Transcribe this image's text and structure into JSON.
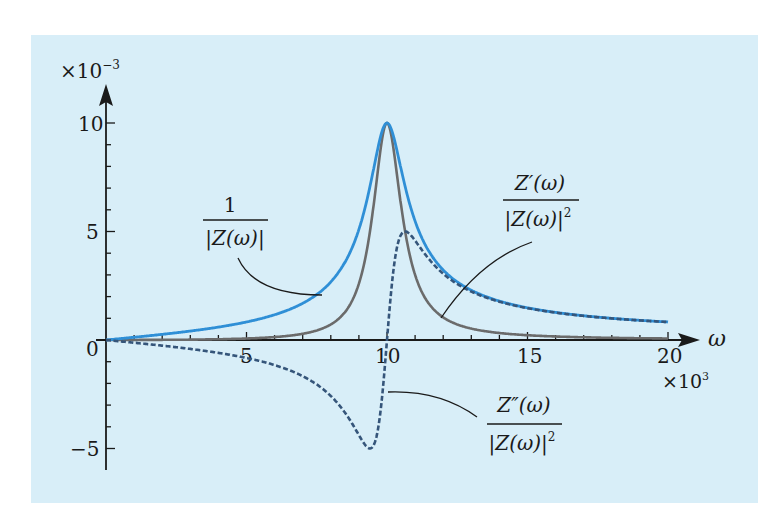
{
  "chart_data": {
    "type": "line",
    "title": "",
    "xlabel": "ω",
    "ylabel": "",
    "x_multiplier": "×10³",
    "y_multiplier": "×10⁻³",
    "xlim": [
      0,
      20
    ],
    "ylim": [
      -5.5,
      11
    ],
    "x_ticks": [
      0,
      5,
      10,
      15,
      20
    ],
    "x_tick_labels": [
      "0",
      "5",
      "10",
      "15",
      "20"
    ],
    "x_minor_step": 1,
    "y_ticks": [
      -5,
      5,
      10
    ],
    "y_tick_labels": [
      "−5",
      "5",
      "10"
    ],
    "y_minor_step": 1,
    "origin_label": "0",
    "grid": false,
    "legend": "inline annotations",
    "model": {
      "R": 100,
      "L": 0.08,
      "omega0_k": 10
    },
    "x": [
      0,
      1,
      2,
      3,
      4,
      5,
      6,
      7,
      8,
      9,
      9.5,
      10,
      10.5,
      11,
      12,
      13,
      14,
      15,
      16,
      17,
      18,
      19,
      20
    ],
    "series": [
      {
        "name": "1/|Z(ω)|",
        "style": "solid",
        "color": "#2f8fd6",
        "values": [
          0,
          0.13,
          0.26,
          0.41,
          0.59,
          0.83,
          1.17,
          1.7,
          2.64,
          5.05,
          7.37,
          10.0,
          7.58,
          5.47,
          3.14,
          2.16,
          1.65,
          1.33,
          1.12,
          0.97,
          0.85,
          0.76,
          0.69
        ]
      },
      {
        "name": "Z'(ω)/|Z(ω)|²",
        "style": "solid",
        "color": "#6b6b6b",
        "values": [
          0,
          0.0,
          0.01,
          0.02,
          0.03,
          0.07,
          0.14,
          0.29,
          0.7,
          2.55,
          5.43,
          10.0,
          5.75,
          2.99,
          0.99,
          0.47,
          0.27,
          0.18,
          0.13,
          0.09,
          0.07,
          0.06,
          0.05
        ]
      },
      {
        "name": "Z''(ω)/|Z(ω)|²",
        "style": "dashed",
        "color": "#35557a",
        "values": [
          0,
          -0.13,
          -0.26,
          -0.41,
          -0.59,
          -0.82,
          -1.16,
          -1.68,
          -2.54,
          -4.36,
          -4.98,
          0,
          4.94,
          4.62,
          2.98,
          2.11,
          1.63,
          1.32,
          1.11,
          0.96,
          0.85,
          0.76,
          0.69
        ]
      }
    ],
    "annotations": [
      {
        "target": "1/|Z(ω)|",
        "numerator": "1",
        "denominator": "|Z(ω)|"
      },
      {
        "target": "Z'(ω)/|Z(ω)|²",
        "numerator": "Z′(ω)",
        "denominator": "|Z(ω)|²"
      },
      {
        "target": "Z''(ω)/|Z(ω)|²",
        "numerator": "Z″(ω)",
        "denominator": "|Z(ω)|²"
      }
    ]
  },
  "labels": {
    "y_mult_base": "×10",
    "y_mult_exp": "−3",
    "x_mult_base": "×10",
    "x_mult_exp": "3",
    "x_axis": "ω",
    "origin": "0",
    "x5": "5",
    "x10": "10",
    "x15": "15",
    "x20": "20",
    "y10": "10",
    "y5": "5",
    "ym5": "−5",
    "ann1_num": "1",
    "ann1_den": "|Z(ω)|",
    "ann2_num": "Z′(ω)",
    "ann2_den": "|Z(ω)|",
    "ann2_exp": "2",
    "ann3_num": "Z″(ω)",
    "ann3_den": "|Z(ω)|",
    "ann3_exp": "2"
  },
  "colors": {
    "background": "#d8eef8",
    "abs_inverse": "#2f8fd6",
    "real_part": "#6b6b6b",
    "imag_part": "#35557a",
    "axis": "#1a1a1a"
  }
}
